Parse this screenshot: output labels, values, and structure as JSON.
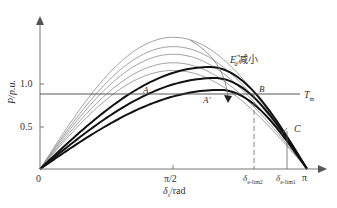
{
  "chart_data": {
    "type": "line",
    "title": "",
    "xlabel": "δs/rad",
    "ylabel": "P/p.u.",
    "x_ticks": [
      "0",
      "π/2",
      "δe-lim2",
      "δe-lim1",
      "π"
    ],
    "y_ticks": [
      "0.5",
      "1.0"
    ],
    "xlim": [
      0,
      3.1416
    ],
    "ylim": [
      0,
      1.7
    ],
    "grid": false,
    "horizontal_line": {
      "label": "Tm",
      "y": 0.88
    },
    "series_thin": [
      {
        "name": "thin-1",
        "peak_x": 1.57,
        "peak_y": 1.55
      },
      {
        "name": "thin-2",
        "peak_x": 1.57,
        "peak_y": 1.44
      },
      {
        "name": "thin-3",
        "peak_x": 1.57,
        "peak_y": 1.35
      },
      {
        "name": "thin-4",
        "peak_x": 1.57,
        "peak_y": 1.25
      },
      {
        "name": "thin-5",
        "peak_x": 1.57,
        "peak_y": 1.16
      }
    ],
    "series_thick": [
      {
        "name": "thick-1",
        "peak_x": 2.0,
        "peak_y": 1.2
      },
      {
        "name": "thick-2",
        "peak_x": 2.06,
        "peak_y": 1.07
      },
      {
        "name": "thick-3",
        "peak_x": 2.12,
        "peak_y": 0.93
      }
    ],
    "annotations": [
      {
        "text": "A",
        "x": 1.33,
        "y": 0.92
      },
      {
        "text": "A'",
        "x": 1.89,
        "y": 0.8
      },
      {
        "text": "B",
        "x": 2.55,
        "y": 0.95
      },
      {
        "text": "C",
        "x": 2.95,
        "y": 0.45
      },
      {
        "text": "E'd 减小",
        "x": 2.25,
        "y": 1.4
      }
    ],
    "dashed_verticals": [
      {
        "label": "δe-lim2",
        "x": 2.52
      },
      {
        "label": "δe-lim1",
        "x": 2.9
      }
    ]
  },
  "labels": {
    "y_axis": "P/p.u.",
    "x_axis_prefix": "δ",
    "x_axis_sub": "s",
    "x_axis_suffix": "/rad",
    "tick_0": "0",
    "tick_pi2": "π/2",
    "tick_pi": "π",
    "tick_lim2": "δ",
    "tick_lim2_sub": "e-lim2",
    "tick_lim1": "δ",
    "tick_lim1_sub": "e-lim1",
    "y_05": "0.5",
    "y_10": "1.0",
    "tm": "T",
    "tm_sub": "m",
    "point_a": "A",
    "point_a2": "A'",
    "point_b": "B",
    "point_c": "C",
    "ed_main": "E",
    "ed_sup": "\"",
    "ed_sub": "d",
    "ed_text": "减小"
  }
}
